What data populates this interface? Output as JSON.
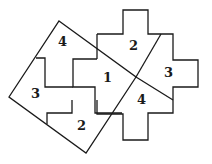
{
  "diagram": {
    "title": "",
    "stroke_color": "#1a1a1a",
    "background": "#ffffff",
    "labels": [
      {
        "id": "square-piece-4",
        "text": "4",
        "x": 58,
        "y": 46
      },
      {
        "id": "square-piece-3",
        "text": "3",
        "x": 33,
        "y": 96
      },
      {
        "id": "square-piece-2",
        "text": "2",
        "x": 79,
        "y": 130
      },
      {
        "id": "center-piece-1",
        "text": "1",
        "x": 104,
        "y": 81
      },
      {
        "id": "cross-piece-2",
        "text": "2",
        "x": 129,
        "y": 49
      },
      {
        "id": "cross-piece-3",
        "text": "3",
        "x": 165,
        "y": 74
      },
      {
        "id": "cross-piece-4",
        "text": "4",
        "x": 137,
        "y": 101
      }
    ]
  }
}
